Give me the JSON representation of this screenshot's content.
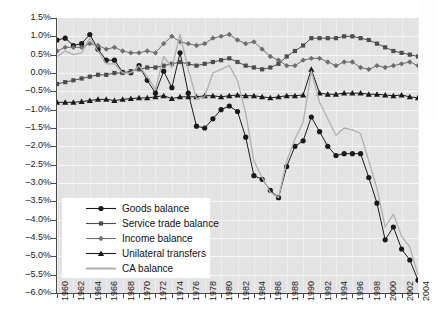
{
  "chart_data": {
    "type": "line",
    "title": "",
    "xlabel": "",
    "ylabel": "",
    "ylim": [
      -6.0,
      1.5
    ],
    "ytick_step": 0.5,
    "grid": true,
    "legend_position": "inside-lower-left",
    "value_suffix": "%",
    "ytick_labels": [
      "1.5%",
      "1.0%",
      "0.5%",
      "0.0%",
      "-0.5%",
      "-1.0%",
      "-1.5%",
      "-2.0%",
      "-2.5%",
      "-3.0%",
      "-3.5%",
      "-4.0%",
      "-4.5%",
      "-5.0%",
      "-5.5%",
      "-6.0%"
    ],
    "ytick_values": [
      1.5,
      1.0,
      0.5,
      0.0,
      -0.5,
      -1.0,
      -1.5,
      -2.0,
      -2.5,
      -3.0,
      -3.5,
      -4.0,
      -4.5,
      -5.0,
      -5.5,
      -6.0
    ],
    "xtick_labels": [
      "1960",
      "1962",
      "1964",
      "1966",
      "1968",
      "1970",
      "1972",
      "1974",
      "1976",
      "1978",
      "1980",
      "1982",
      "1984",
      "1986",
      "1988",
      "1990",
      "1992",
      "1994",
      "1996",
      "1998",
      "2000",
      "2002",
      "2004"
    ],
    "x": [
      1960,
      1961,
      1962,
      1963,
      1964,
      1965,
      1966,
      1967,
      1968,
      1969,
      1970,
      1971,
      1972,
      1973,
      1974,
      1975,
      1976,
      1977,
      1978,
      1979,
      1980,
      1981,
      1982,
      1983,
      1984,
      1985,
      1986,
      1987,
      1988,
      1989,
      1990,
      1991,
      1992,
      1993,
      1994,
      1995,
      1996,
      1997,
      1998,
      1999,
      2000,
      2001,
      2002,
      2003,
      2004
    ],
    "series": [
      {
        "name": "Goods balance",
        "color": "#1a1a1a",
        "marker": "circle",
        "values": [
          0.9,
          0.95,
          0.75,
          0.8,
          1.05,
          0.65,
          0.35,
          0.35,
          0.02,
          0.01,
          0.2,
          -0.2,
          -0.55,
          0.05,
          -0.4,
          0.55,
          -0.55,
          -1.45,
          -1.5,
          -1.25,
          -1.0,
          -0.9,
          -1.05,
          -1.75,
          -2.8,
          -2.9,
          -3.2,
          -3.4,
          -2.55,
          -2.0,
          -1.85,
          -1.2,
          -1.6,
          -2.0,
          -2.25,
          -2.2,
          -2.2,
          -2.2,
          -2.85,
          -3.55,
          -4.55,
          -4.2,
          -4.8,
          -5.1,
          -5.65
        ]
      },
      {
        "name": "Service trade balance",
        "color": "#4d4d4d",
        "marker": "square",
        "values": [
          -0.3,
          -0.25,
          -0.2,
          -0.15,
          -0.1,
          -0.05,
          -0.05,
          0.0,
          0.0,
          0.05,
          0.1,
          0.15,
          0.15,
          0.2,
          0.25,
          0.3,
          0.25,
          0.2,
          0.25,
          0.3,
          0.35,
          0.4,
          0.3,
          0.2,
          0.15,
          0.1,
          0.15,
          0.25,
          0.45,
          0.6,
          0.75,
          0.95,
          0.95,
          0.95,
          0.95,
          1.0,
          1.0,
          0.95,
          0.9,
          0.8,
          0.7,
          0.6,
          0.55,
          0.5,
          0.45
        ]
      },
      {
        "name": "Income balance",
        "color": "#6e6e6e",
        "marker": "diamond",
        "values": [
          0.6,
          0.7,
          0.7,
          0.7,
          0.8,
          0.75,
          0.65,
          0.7,
          0.6,
          0.55,
          0.55,
          0.6,
          0.55,
          0.8,
          1.0,
          0.85,
          0.8,
          0.75,
          0.8,
          0.95,
          1.0,
          1.05,
          0.9,
          0.8,
          0.85,
          0.65,
          0.45,
          0.35,
          0.2,
          0.2,
          0.35,
          0.4,
          0.4,
          0.3,
          0.2,
          0.3,
          0.3,
          0.15,
          0.1,
          0.2,
          0.15,
          0.2,
          0.25,
          0.3,
          0.2
        ]
      },
      {
        "name": "Unilateral transfers",
        "color": "#1a1a1a",
        "marker": "triangle",
        "values": [
          -0.8,
          -0.8,
          -0.8,
          -0.78,
          -0.75,
          -0.72,
          -0.72,
          -0.75,
          -0.72,
          -0.7,
          -0.68,
          -0.68,
          -0.65,
          -0.62,
          -0.7,
          -0.65,
          -0.65,
          -0.65,
          -0.62,
          -0.62,
          -0.65,
          -0.62,
          -0.6,
          -0.62,
          -0.62,
          -0.65,
          -0.68,
          -0.65,
          -0.62,
          -0.62,
          -0.6,
          0.1,
          -0.55,
          -0.58,
          -0.58,
          -0.55,
          -0.55,
          -0.55,
          -0.58,
          -0.58,
          -0.6,
          -0.62,
          -0.6,
          -0.65,
          -0.68
        ]
      },
      {
        "name": "CA balance",
        "color": "#b0b0b0",
        "marker": "none",
        "values": [
          0.45,
          0.6,
          0.5,
          0.55,
          0.95,
          0.6,
          0.25,
          0.25,
          0.0,
          0.0,
          0.2,
          -0.1,
          -0.45,
          0.45,
          0.15,
          1.05,
          0.1,
          -0.7,
          -0.65,
          0.0,
          0.1,
          0.2,
          -0.2,
          -1.1,
          -2.4,
          -2.85,
          -3.25,
          -3.4,
          -2.4,
          -1.8,
          -1.35,
          0.05,
          -0.8,
          -1.25,
          -1.7,
          -1.5,
          -1.55,
          -1.65,
          -2.4,
          -3.15,
          -4.2,
          -3.85,
          -4.45,
          -4.75,
          -5.5
        ]
      }
    ]
  },
  "legend": {
    "items": [
      {
        "label": "Goods balance"
      },
      {
        "label": "Service trade balance"
      },
      {
        "label": "Income balance"
      },
      {
        "label": "Unilateral transfers"
      },
      {
        "label": "CA balance"
      }
    ]
  }
}
